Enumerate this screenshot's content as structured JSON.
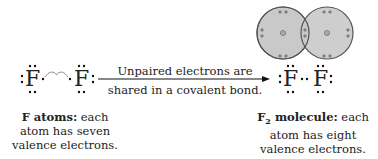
{
  "left": {
    "atom_symbol": "F",
    "caption_bold": "F atoms:",
    "caption_rest": " each",
    "caption_line2": "atom has seven",
    "caption_line3": "valence electrons."
  },
  "arrow": {
    "label_line1": "Unpaired electrons are",
    "label_line2": "shared in a covalent bond."
  },
  "right": {
    "atom_symbol": "F",
    "caption_bold_main": "F",
    "caption_bold_sub": "2",
    "caption_bold_tail": " molecule:",
    "caption_rest": " each",
    "caption_line2": "atom has eight",
    "caption_line3": "valence electrons."
  },
  "colors": {
    "circle_fill": "#c9c9c9",
    "circle_stroke": "#555555",
    "text": "#222222"
  }
}
